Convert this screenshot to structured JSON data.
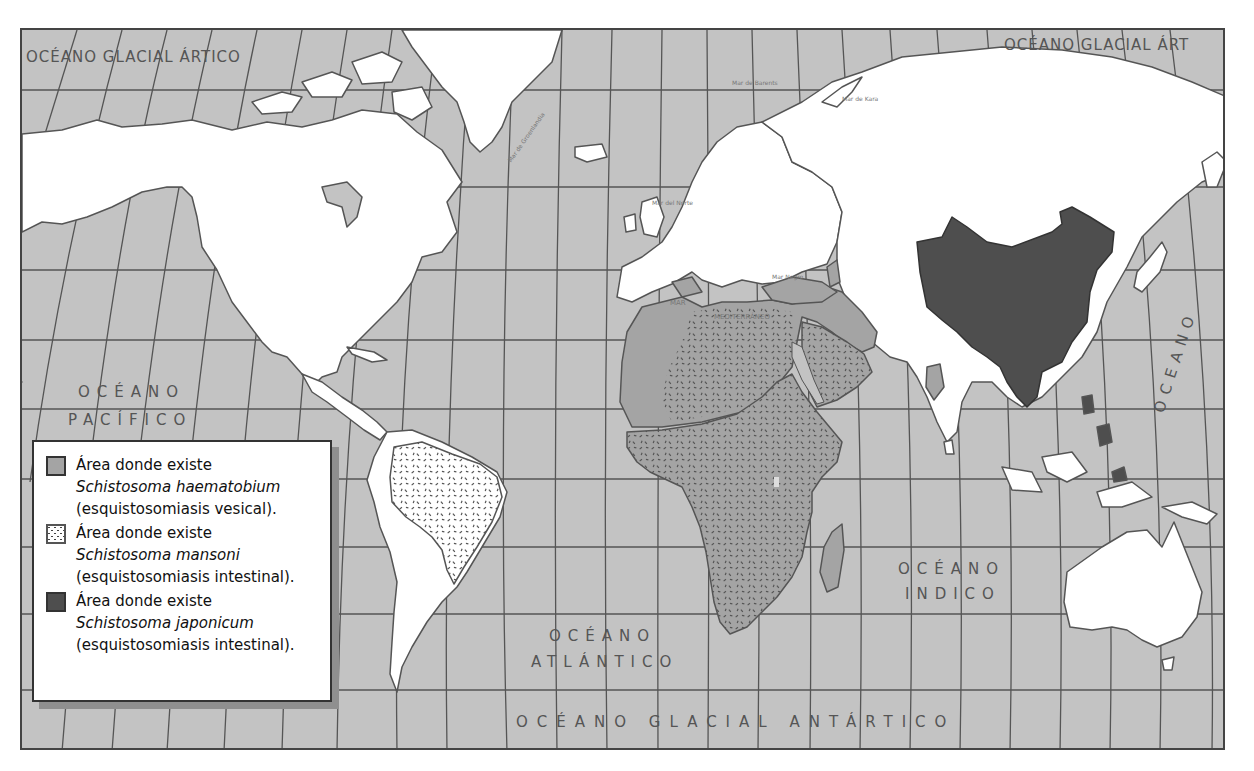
{
  "map": {
    "colors": {
      "ocean": "#c3c3c3",
      "land": "#ffffff",
      "haematobium": "#a4a4a4",
      "mansoni_dots": "#666666",
      "japonicum": "#4e4e4e",
      "grid": "#555555",
      "coast": "#555555"
    },
    "ocean_labels": {
      "arctic_left": "OCÉANO GLACIAL ÁRTICO",
      "arctic_right": "OCÉANO GLACIAL ÁRT",
      "pacific_1": "OCÉANO",
      "pacific_2": "PACÍFICO",
      "atlantic_1": "OCÉANO",
      "atlantic_2": "ATLÁNTICO",
      "indian_1": "OCÉANO",
      "indian_2": "INDICO",
      "antarctic": "OCÉANO GLACIAL ANTÁRTICO",
      "pacific_right": "OCEANO"
    },
    "sea_labels": {
      "barents": "Mar de Barents",
      "kara": "Mar de Kara",
      "north_sea": "Mar del Norte",
      "greenland": "Mar de Groenlandia",
      "black_sea": "Mar Negro",
      "mediterranean_1": "MAR",
      "mediterranean_2": "MEDITERRÁNEO"
    }
  },
  "legend": {
    "items": [
      {
        "pattern": "solid-medium-gray",
        "line1": "Área donde existe",
        "species": "Schistosoma haematobium",
        "disease": "(esquistosomiasis vesical)."
      },
      {
        "pattern": "dotted-white",
        "line1": "Área donde existe",
        "species": "Schistosoma mansoni",
        "disease": "(esquistosomiasis intestinal)."
      },
      {
        "pattern": "solid-dark-gray",
        "line1": "Área donde existe",
        "species": "Schistosoma japonicum",
        "disease": "(esquistosomiasis intestinal)."
      }
    ]
  }
}
